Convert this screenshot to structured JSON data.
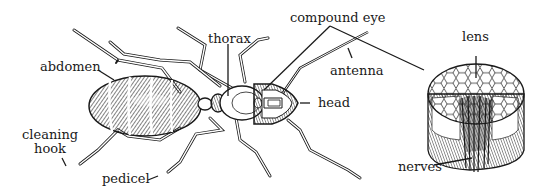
{
  "diagram": {
    "colors": {
      "ink": "#1a1a1a",
      "background": "#ffffff"
    },
    "labels": {
      "abdomen": "abdomen",
      "thorax": "thorax",
      "compound_eye": "compound eye",
      "antenna": "antenna",
      "head": "head",
      "lens": "lens",
      "nerves": "nerves",
      "cleaning_hook": "cleaning\nhook",
      "pedicel": "pedicel"
    }
  }
}
